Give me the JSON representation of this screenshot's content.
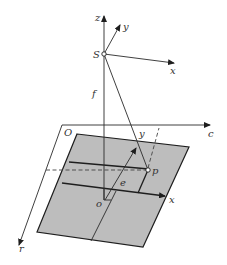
{
  "figure": {
    "colors": {
      "line": "#2a2a2a",
      "plane_fill": "#bdbdbd",
      "background": "#ffffff",
      "label": "#333333"
    },
    "labels": {
      "camera_z": "z",
      "camera_y": "y",
      "camera_x": "x",
      "perspective_center": "S",
      "focal_length": "f",
      "origin_ground": "O",
      "axis_c": "c",
      "axis_r": "r",
      "image_y": "y",
      "image_x": "x",
      "image_point": "p",
      "principal_point": "o",
      "e_axis": "e"
    }
  }
}
